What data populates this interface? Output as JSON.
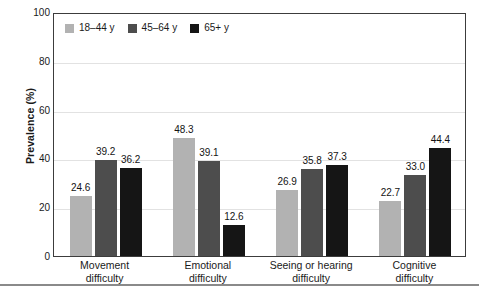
{
  "chart_data": {
    "type": "bar",
    "title": "",
    "subtitle": "",
    "xlabel": "",
    "ylabel": "Prevalence (%)",
    "ylim": [
      0,
      100
    ],
    "yticks": [
      0,
      20,
      40,
      60,
      80,
      100
    ],
    "ytick_labels": [
      "0",
      "20",
      "40",
      "60",
      "80",
      "100"
    ],
    "grid": "horizontal",
    "legend_position": "top-left-inside",
    "categories": [
      "Movement difficulty",
      "Emotional difficulty",
      "Seeing or hearing difficulty",
      "Cognitive difficulty"
    ],
    "category_lines": [
      [
        "Movement",
        "difficulty"
      ],
      [
        "Emotional",
        "difficulty"
      ],
      [
        "Seeing or hearing",
        "difficulty"
      ],
      [
        "Cognitive",
        "difficulty"
      ]
    ],
    "series": [
      {
        "name": "18–44 y",
        "color": "#b2b2b2",
        "values": [
          24.6,
          48.3,
          26.9,
          22.7
        ],
        "labels": [
          "24.6",
          "48.3",
          "26.9",
          "22.7"
        ]
      },
      {
        "name": "45–64 y",
        "color": "#4d4d4d",
        "values": [
          39.2,
          39.1,
          35.8,
          33.0
        ],
        "labels": [
          "39.2",
          "39.1",
          "35.8",
          "33.0"
        ]
      },
      {
        "name": "65+ y",
        "color": "#151515",
        "values": [
          36.2,
          12.6,
          37.3,
          44.4
        ],
        "labels": [
          "36.2",
          "12.6",
          "37.3",
          "44.4"
        ]
      }
    ]
  },
  "colors": {
    "series_18_44": "#b2b2b2",
    "series_45_64": "#4d4d4d",
    "series_65_plus": "#151515",
    "axis": "#3c3c3c",
    "grid": "#e2e2e2",
    "text": "#1a1a1a",
    "footer_rule": "#8a8a8a",
    "background": "#ffffff"
  }
}
